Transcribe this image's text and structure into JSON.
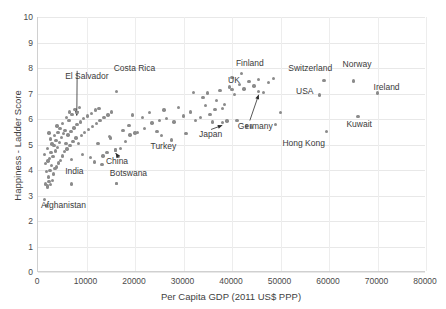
{
  "chart_data": {
    "type": "scatter",
    "title": "",
    "xlabel": "Per Capita GDP (2011 US$ PPP)",
    "ylabel": "Happiness - Ladder Score",
    "xlim": [
      0,
      80000
    ],
    "ylim": [
      0,
      10
    ],
    "xticks": [
      0,
      10000,
      20000,
      30000,
      40000,
      50000,
      60000,
      70000,
      80000
    ],
    "yticks": [
      0,
      1,
      2,
      3,
      4,
      5,
      6,
      7,
      8,
      9,
      10
    ],
    "xtick_labels": [
      "0",
      "10000",
      "20000",
      "30000",
      "40000",
      "50000",
      "60000",
      "70000",
      "80000"
    ],
    "ytick_labels": [
      "0",
      "1",
      "2",
      "3",
      "4",
      "5",
      "6",
      "7",
      "8",
      "9",
      "10"
    ],
    "grid": "both",
    "legend": "none",
    "marker_color": "#8b8b8b",
    "gridline_color": "#e8e8e8",
    "series": [
      {
        "name": "Countries",
        "points": [
          [
            1400,
            2.85
          ],
          [
            1800,
            2.62
          ],
          [
            1600,
            3.45
          ],
          [
            2000,
            3.38
          ],
          [
            2300,
            3.55
          ],
          [
            1900,
            3.32
          ],
          [
            2600,
            3.42
          ],
          [
            3000,
            3.6
          ],
          [
            2200,
            3.72
          ],
          [
            1700,
            3.95
          ],
          [
            2500,
            3.98
          ],
          [
            3200,
            3.85
          ],
          [
            3500,
            4.05
          ],
          [
            2800,
            4.18
          ],
          [
            1500,
            4.25
          ],
          [
            2100,
            4.35
          ],
          [
            3800,
            4.12
          ],
          [
            4200,
            4.28
          ],
          [
            2400,
            4.45
          ],
          [
            3100,
            4.52
          ],
          [
            4600,
            4.38
          ],
          [
            1300,
            4.62
          ],
          [
            2700,
            4.68
          ],
          [
            3600,
            4.75
          ],
          [
            5000,
            4.55
          ],
          [
            2000,
            4.85
          ],
          [
            4000,
            4.88
          ],
          [
            5400,
            4.72
          ],
          [
            3300,
            4.95
          ],
          [
            2900,
            5.02
          ],
          [
            6000,
            4.82
          ],
          [
            4400,
            5.08
          ],
          [
            3700,
            5.15
          ],
          [
            5800,
            5.05
          ],
          [
            2600,
            5.22
          ],
          [
            6600,
            4.95
          ],
          [
            4800,
            5.28
          ],
          [
            3400,
            5.35
          ],
          [
            7200,
            5.12
          ],
          [
            5200,
            5.42
          ],
          [
            4100,
            5.48
          ],
          [
            7800,
            5.25
          ],
          [
            6200,
            5.38
          ],
          [
            2300,
            5.45
          ],
          [
            8400,
            5.05
          ],
          [
            5600,
            5.55
          ],
          [
            4500,
            5.62
          ],
          [
            9000,
            5.35
          ],
          [
            6800,
            5.52
          ],
          [
            3900,
            5.72
          ],
          [
            9600,
            5.48
          ],
          [
            7400,
            5.65
          ],
          [
            5100,
            5.82
          ],
          [
            10400,
            5.58
          ],
          [
            8000,
            5.78
          ],
          [
            6400,
            5.95
          ],
          [
            11200,
            5.7
          ],
          [
            8800,
            5.88
          ],
          [
            5900,
            6.05
          ],
          [
            12000,
            5.82
          ],
          [
            9400,
            6.02
          ],
          [
            7000,
            6.18
          ],
          [
            12800,
            5.95
          ],
          [
            10200,
            6.12
          ],
          [
            6500,
            6.28
          ],
          [
            13600,
            6.05
          ],
          [
            11000,
            6.22
          ],
          [
            7600,
            6.38
          ],
          [
            14400,
            6.15
          ],
          [
            11800,
            6.35
          ],
          [
            8600,
            6.45
          ],
          [
            15200,
            6.28
          ],
          [
            12600,
            6.42
          ],
          [
            9200,
            4.62
          ],
          [
            16000,
            4.78
          ],
          [
            6900,
            4.42
          ],
          [
            13400,
            4.55
          ],
          [
            10800,
            4.48
          ],
          [
            17000,
            4.85
          ],
          [
            14200,
            4.68
          ],
          [
            11600,
            4.32
          ],
          [
            18000,
            5.12
          ],
          [
            15000,
            5.25
          ],
          [
            12400,
            5.05
          ],
          [
            19000,
            5.38
          ],
          [
            16500,
            4.52
          ],
          [
            13200,
            4.22
          ],
          [
            20500,
            5.48
          ],
          [
            17500,
            5.55
          ],
          [
            14800,
            5.32
          ],
          [
            22000,
            5.62
          ],
          [
            18800,
            5.75
          ],
          [
            16200,
            3.48
          ],
          [
            23500,
            5.85
          ],
          [
            20000,
            5.45
          ],
          [
            25000,
            5.95
          ],
          [
            21500,
            6.05
          ],
          [
            19500,
            6.15
          ],
          [
            26500,
            6.02
          ],
          [
            23000,
            6.25
          ],
          [
            28000,
            5.88
          ],
          [
            24500,
            5.52
          ],
          [
            30000,
            6.12
          ],
          [
            26000,
            6.35
          ],
          [
            27500,
            5.18
          ],
          [
            31500,
            6.28
          ],
          [
            29000,
            6.45
          ],
          [
            32500,
            5.95
          ],
          [
            33500,
            6.05
          ],
          [
            30500,
            5.42
          ],
          [
            34500,
            6.52
          ],
          [
            35500,
            6.18
          ],
          [
            32000,
            7.05
          ],
          [
            36500,
            6.38
          ],
          [
            37500,
            7.12
          ],
          [
            38500,
            6.58
          ],
          [
            34000,
            6.85
          ],
          [
            39500,
            7.25
          ],
          [
            40500,
            6.95
          ],
          [
            36000,
            5.88
          ],
          [
            41500,
            7.35
          ],
          [
            42500,
            7.18
          ],
          [
            38000,
            6.42
          ],
          [
            43500,
            7.48
          ],
          [
            44500,
            7.3
          ],
          [
            45500,
            7.55
          ],
          [
            40000,
            7.62
          ],
          [
            46500,
            7.05
          ],
          [
            47500,
            7.42
          ],
          [
            48500,
            7.6
          ],
          [
            39000,
            5.92
          ],
          [
            43000,
            5.72
          ],
          [
            44000,
            5.68
          ],
          [
            36800,
            6.72
          ],
          [
            35000,
            7.02
          ],
          [
            41000,
            5.95
          ],
          [
            50000,
            6.25
          ],
          [
            49000,
            5.78
          ]
        ]
      }
    ],
    "annotations": [
      {
        "label": "El Salvador",
        "x": 8000,
        "y": 6.25,
        "label_x": 7.0,
        "label_y": 21.5,
        "leader": true
      },
      {
        "label": "Costa Rica",
        "x": 16200,
        "y": 7.08,
        "label_x": 19.5,
        "label_y": 18.5,
        "leader": false
      },
      {
        "label": "India",
        "x": 6900,
        "y": 3.45,
        "label_x": 7.0,
        "label_y": 59.0,
        "leader": false
      },
      {
        "label": "Afghanistan",
        "x": 1800,
        "y": 2.62,
        "label_x": 0.8,
        "label_y": 72.0,
        "leader": false
      },
      {
        "label": "China",
        "x": 16000,
        "y": 4.78,
        "label_x": 17.5,
        "label_y": 55.0,
        "leader": true
      },
      {
        "label": "Botswana",
        "x": 16200,
        "y": 3.48,
        "label_x": 18.5,
        "label_y": 59.5,
        "leader": false
      },
      {
        "label": "Turkey",
        "x": 25500,
        "y": 5.35,
        "label_x": 29.0,
        "label_y": 49.0,
        "leader": false
      },
      {
        "label": "Japan",
        "x": 38000,
        "y": 5.87,
        "label_x": 41.5,
        "label_y": 44.5,
        "leader": true
      },
      {
        "label": "Germany",
        "x": 45500,
        "y": 7.07,
        "label_x": 51.5,
        "label_y": 41.0,
        "leader": true
      },
      {
        "label": "Finland",
        "x": 42000,
        "y": 7.78,
        "label_x": 51.0,
        "label_y": 16.5,
        "leader": false
      },
      {
        "label": "UK",
        "x": 40000,
        "y": 7.15,
        "label_x": 49.0,
        "label_y": 23.0,
        "leader": false
      },
      {
        "label": "Switzerland",
        "x": 59000,
        "y": 7.51,
        "label_x": 64.5,
        "label_y": 18.5,
        "leader": false
      },
      {
        "label": "USA",
        "x": 58000,
        "y": 6.94,
        "label_x": 66.5,
        "label_y": 27.5,
        "leader": false
      },
      {
        "label": "Hong Kong",
        "x": 59500,
        "y": 5.51,
        "label_x": 63.0,
        "label_y": 48.0,
        "leader": false
      },
      {
        "label": "Norway",
        "x": 65000,
        "y": 7.49,
        "label_x": 78.5,
        "label_y": 17.0,
        "leader": false
      },
      {
        "label": "Kuwait",
        "x": 66000,
        "y": 6.1,
        "label_x": 79.5,
        "label_y": 40.5,
        "leader": false
      },
      {
        "label": "Ireland",
        "x": 70000,
        "y": 7.02,
        "label_x": 86.5,
        "label_y": 26.0,
        "leader": false
      }
    ]
  }
}
